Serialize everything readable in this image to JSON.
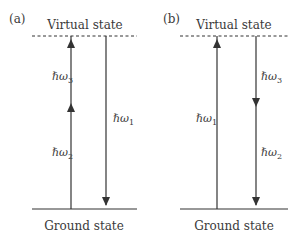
{
  "diagram": {
    "type": "energy-level-diagram",
    "panels": [
      {
        "id": "a",
        "label": "(a)",
        "top_level_label": "Virtual state",
        "bottom_level_label": "Ground state",
        "transitions": [
          {
            "label": "ℏω",
            "subscript": "2",
            "direction": "up",
            "segment": "lower"
          },
          {
            "label": "ℏω",
            "subscript": "3",
            "direction": "up",
            "segment": "upper"
          },
          {
            "label": "ℏω",
            "subscript": "1",
            "direction": "down",
            "segment": "full"
          }
        ]
      },
      {
        "id": "b",
        "label": "(b)",
        "top_level_label": "Virtual state",
        "bottom_level_label": "Ground state",
        "transitions": [
          {
            "label": "ℏω",
            "subscript": "1",
            "direction": "up",
            "segment": "full"
          },
          {
            "label": "ℏω",
            "subscript": "3",
            "direction": "down",
            "segment": "upper"
          },
          {
            "label": "ℏω",
            "subscript": "2",
            "direction": "down",
            "segment": "lower"
          }
        ]
      }
    ],
    "colors": {
      "line": "#333333",
      "text": "#3a3a3a",
      "background": "#ffffff"
    }
  }
}
